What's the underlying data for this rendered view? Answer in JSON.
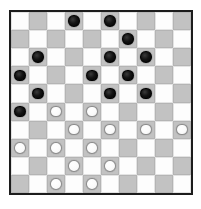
{
  "app": {
    "title": "International Draughts Board",
    "background_color": "#ffffff"
  },
  "board": {
    "name": "draughts-board",
    "variant": "International Draughts (10x10)",
    "rows": 10,
    "columns": 10,
    "border_color": "#1c1c1c",
    "light_square_color": "#fdfdfd",
    "dark_square_color": "#c2c2c2",
    "dark_square_rule": "dark when (row + column) is odd",
    "black_piece_color": "#141414",
    "white_piece_color": "#fbfbfb",
    "black_piece_count": 15,
    "white_piece_count": 13,
    "squares": [
      [
        "",
        "",
        "",
        "black",
        "",
        "black",
        "",
        "",
        "",
        ""
      ],
      [
        "",
        "",
        "",
        "",
        "",
        "",
        "black",
        "",
        "",
        ""
      ],
      [
        "",
        "black",
        "",
        "",
        "",
        "black",
        "",
        "black",
        "",
        ""
      ],
      [
        "black",
        "",
        "",
        "",
        "black",
        "",
        "black",
        "",
        "",
        ""
      ],
      [
        "",
        "black",
        "",
        "",
        "",
        "black",
        "",
        "black",
        "",
        ""
      ],
      [
        "black",
        "",
        "white",
        "",
        "white",
        "",
        "",
        "",
        "",
        ""
      ],
      [
        "",
        "",
        "",
        "white",
        "",
        "white",
        "",
        "white",
        "",
        "white"
      ],
      [
        "white",
        "",
        "white",
        "",
        "white",
        "",
        "",
        "",
        "",
        ""
      ],
      [
        "",
        "",
        "",
        "white",
        "",
        "white",
        "",
        "",
        "",
        ""
      ],
      [
        "",
        "",
        "white",
        "",
        "white",
        "",
        "",
        "",
        "",
        ""
      ]
    ]
  }
}
